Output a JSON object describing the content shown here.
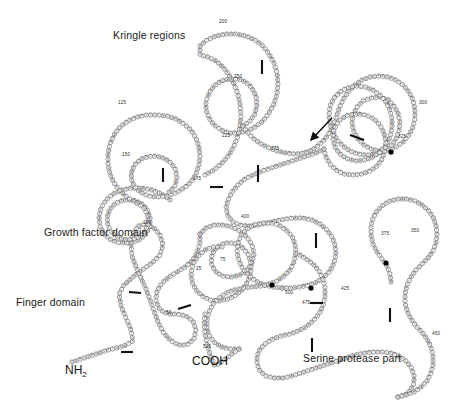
{
  "figure": {
    "type": "protein-domain-diagram",
    "background_color": "#ffffff",
    "residue_outline_color": "#4a4a4a",
    "residue_fill_color": "#ffffff",
    "bond_color": "#111111",
    "glyco_color": "#000000"
  },
  "domain_labels": [
    {
      "id": "kringle",
      "text": "Kringle regions",
      "x": 113,
      "y": 35,
      "font_size": 10.5
    },
    {
      "id": "growth-factor",
      "text": "Growth factor domain",
      "x": 44,
      "y": 232,
      "font_size": 10.5
    },
    {
      "id": "finger",
      "text": "Finger domain",
      "x": 16,
      "y": 302,
      "font_size": 10.5
    },
    {
      "id": "serine-protease",
      "text": "Serine protease part",
      "x": 303,
      "y": 358,
      "font_size": 10.5
    }
  ],
  "terminus_labels": [
    {
      "id": "n-terminus",
      "text": "NH",
      "sub": "2",
      "x": 65,
      "y": 372
    },
    {
      "id": "c-terminus",
      "text": "COOH",
      "sub": "",
      "x": 192,
      "y": 363
    }
  ],
  "residue_numbers": [
    {
      "value": "25",
      "x": 196,
      "y": 266
    },
    {
      "value": "50",
      "x": 166,
      "y": 310
    },
    {
      "value": "75",
      "x": 220,
      "y": 257
    },
    {
      "value": "100",
      "x": 143,
      "y": 220
    },
    {
      "value": "125",
      "x": 118,
      "y": 100
    },
    {
      "value": "150",
      "x": 122,
      "y": 152
    },
    {
      "value": "175",
      "x": 193,
      "y": 176
    },
    {
      "value": "200",
      "x": 219,
      "y": 19
    },
    {
      "value": "225",
      "x": 222,
      "y": 133
    },
    {
      "value": "250",
      "x": 234,
      "y": 74
    },
    {
      "value": "275",
      "x": 271,
      "y": 146
    },
    {
      "value": "300",
      "x": 419,
      "y": 100
    },
    {
      "value": "325",
      "x": 398,
      "y": 134
    },
    {
      "value": "350",
      "x": 411,
      "y": 228
    },
    {
      "value": "375",
      "x": 381,
      "y": 231
    },
    {
      "value": "400",
      "x": 241,
      "y": 214
    },
    {
      "value": "425",
      "x": 341,
      "y": 286
    },
    {
      "value": "450",
      "x": 432,
      "y": 331
    },
    {
      "value": "475",
      "x": 302,
      "y": 300
    },
    {
      "value": "500",
      "x": 285,
      "y": 290
    },
    {
      "value": "525",
      "x": 203,
      "y": 344
    }
  ],
  "annotations": {
    "arrow": {
      "id": "cleavage-site-arrow",
      "x1": 332,
      "y1": 118,
      "x2": 311,
      "y2": 140
    },
    "glycosylation_sites": [
      {
        "x": 391,
        "y": 152
      },
      {
        "x": 386,
        "y": 263
      },
      {
        "x": 311,
        "y": 288
      },
      {
        "x": 272,
        "y": 285
      }
    ],
    "disulfide_bridges": [
      {
        "x1": 121,
        "y1": 352,
        "x2": 133,
        "y2": 352
      },
      {
        "x1": 129,
        "y1": 292,
        "x2": 141,
        "y2": 293
      },
      {
        "x1": 178,
        "y1": 309,
        "x2": 191,
        "y2": 305
      },
      {
        "x1": 163,
        "y1": 168,
        "x2": 163,
        "y2": 182
      },
      {
        "x1": 258,
        "y1": 165,
        "x2": 258,
        "y2": 182
      },
      {
        "x1": 262,
        "y1": 60,
        "x2": 262,
        "y2": 74
      },
      {
        "x1": 316,
        "y1": 233,
        "x2": 316,
        "y2": 248
      },
      {
        "x1": 310,
        "y1": 303,
        "x2": 323,
        "y2": 303
      },
      {
        "x1": 312,
        "y1": 338,
        "x2": 312,
        "y2": 352
      },
      {
        "x1": 390,
        "y1": 308,
        "x2": 390,
        "y2": 322
      },
      {
        "x1": 350,
        "y1": 135,
        "x2": 364,
        "y2": 140
      },
      {
        "x1": 210,
        "y1": 187,
        "x2": 223,
        "y2": 187
      }
    ]
  },
  "chain_residues": "QNRCSEGWCFTGKAYRGTHSLTESGASCLPWNSMILIGKVYTAQNPSAQALGLGKHNYCRNPDGDAKPWCHVLKNRRLTWEYCDVPSCSTCGLRQYSQPQFRIKGGLFADIASHPWQAAIFAKHRRSPGERFLCGGILISSCWILSAAHCFQERFPPHHLTVILGRTYRVVPGEEEQKFEVEKYIVHKEFDDDTYDNDIALLQLKSDSSRCAQESSVVRTVCLPPADLQLPDWTECELSGYGKHEALSPFYSERLKEAHVRLYPSSRCTSQHLLNRTVTDNMLCAGDTRSGGPQANLHDACQGDSGGPLVCLNDGRMTLVGIISWGLGCGQKDVPGVYTKVTNYLDWIRDNMRP"
}
